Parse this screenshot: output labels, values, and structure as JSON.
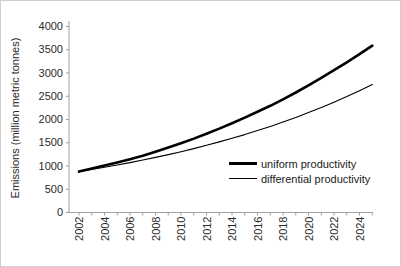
{
  "frame": {
    "background": "#ffffff",
    "border_color": "#cfcfcf"
  },
  "chart_data": {
    "type": "line",
    "title": "",
    "xlabel": "",
    "ylabel": "Emissions (million metric tonnes)",
    "ylim": [
      0,
      4000
    ],
    "y_ticks": [
      0,
      500,
      1000,
      1500,
      2000,
      2500,
      3000,
      3500,
      4000
    ],
    "x": [
      2002,
      2003,
      2004,
      2005,
      2006,
      2007,
      2008,
      2009,
      2010,
      2011,
      2012,
      2013,
      2014,
      2015,
      2016,
      2017,
      2018,
      2019,
      2020,
      2021,
      2022,
      2023,
      2024,
      2025
    ],
    "x_major_tick_labels": [
      "2002",
      "2004",
      "2006",
      "2008",
      "2010",
      "2012",
      "2014",
      "2016",
      "2018",
      "2020",
      "2022",
      "2024"
    ],
    "grid": false,
    "legend_position": "inside-lower-right",
    "axis_color": "#a0a0a0",
    "label_color": "#2b2b2b",
    "series": [
      {
        "name": "uniform productivity",
        "color": "#000000",
        "stroke_width": 2.6,
        "values": [
          880,
          945,
          1010,
          1075,
          1145,
          1220,
          1305,
          1395,
          1490,
          1590,
          1695,
          1805,
          1920,
          2040,
          2165,
          2295,
          2435,
          2580,
          2735,
          2895,
          3060,
          3230,
          3405,
          3590
        ]
      },
      {
        "name": "differential productivity",
        "color": "#000000",
        "stroke_width": 1.1,
        "values": [
          880,
          925,
          972,
          1021,
          1073,
          1128,
          1185,
          1245,
          1308,
          1375,
          1445,
          1518,
          1595,
          1676,
          1761,
          1851,
          1945,
          2044,
          2148,
          2257,
          2372,
          2492,
          2619,
          2752
        ]
      }
    ]
  }
}
